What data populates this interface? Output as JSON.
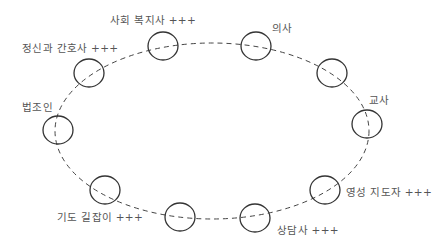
{
  "diagram": {
    "type": "ring-of-nodes",
    "ellipse": {
      "cx": 212,
      "cy": 131,
      "rx": 157,
      "ry": 88,
      "stroke": "#444444",
      "dash": "5,4"
    },
    "nodes": [
      {
        "id": "social-worker",
        "label": "사회 복지사 +++",
        "cx": 163,
        "cy": 46,
        "lx": 110,
        "ly": 12
      },
      {
        "id": "doctor",
        "label": "의사",
        "cx": 256,
        "cy": 46,
        "lx": 272,
        "ly": 20
      },
      {
        "id": "unlabeled-upper-right",
        "label": "",
        "cx": 332,
        "cy": 73,
        "lx": 0,
        "ly": 0
      },
      {
        "id": "teacher",
        "label": "교사",
        "cx": 367,
        "cy": 124,
        "lx": 369,
        "ly": 92
      },
      {
        "id": "spiritual-director",
        "label": "영성 지도자 +++",
        "cx": 325,
        "cy": 190,
        "lx": 346,
        "ly": 184
      },
      {
        "id": "counselor",
        "label": "상담사 +++",
        "cx": 255,
        "cy": 218,
        "lx": 277,
        "ly": 222
      },
      {
        "id": "unlabeled-bottom",
        "label": "",
        "cx": 180,
        "cy": 217,
        "lx": 0,
        "ly": 0
      },
      {
        "id": "prayer-guide",
        "label": "기도 길잡이 +++",
        "cx": 105,
        "cy": 190,
        "lx": 57,
        "ly": 209
      },
      {
        "id": "lawyer",
        "label": "법조인",
        "cx": 58,
        "cy": 130,
        "lx": 22,
        "ly": 99
      },
      {
        "id": "psychiatric-nurse",
        "label": "정신과 간호사 +++",
        "cx": 89,
        "cy": 73,
        "lx": 22,
        "ly": 40
      }
    ],
    "node_rx": 15,
    "node_ry": 14,
    "node_stroke": "#333333",
    "label_color": "#555555"
  }
}
